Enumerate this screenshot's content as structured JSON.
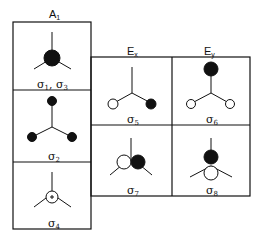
{
  "columns": [
    {
      "id": "A1",
      "label": "A",
      "sub": "1"
    },
    {
      "id": "Ex",
      "label": "E",
      "sub": "x"
    },
    {
      "id": "Ey",
      "label": "E",
      "sub": "y"
    }
  ],
  "cells": [
    {
      "column": "A1",
      "label": "σ",
      "sub": "1",
      "extra": ", σ",
      "extra_sub": "3",
      "icon": "filled-center-orbital"
    },
    {
      "column": "A1",
      "label": "σ",
      "sub": "2",
      "icon": "three-filled-lobes"
    },
    {
      "column": "A1",
      "label": "σ",
      "sub": "4",
      "icon": "plus-center-orbital"
    },
    {
      "column": "Ex",
      "label": "σ",
      "sub": "5",
      "icon": "open-filled-lobes"
    },
    {
      "column": "Ey",
      "label": "σ",
      "sub": "6",
      "icon": "filled-top-open-lobes"
    },
    {
      "column": "Ex",
      "label": "σ",
      "sub": "7",
      "icon": "open-filled-pair"
    },
    {
      "column": "Ey",
      "label": "σ",
      "sub": "8",
      "icon": "filled-over-open-pair"
    }
  ]
}
